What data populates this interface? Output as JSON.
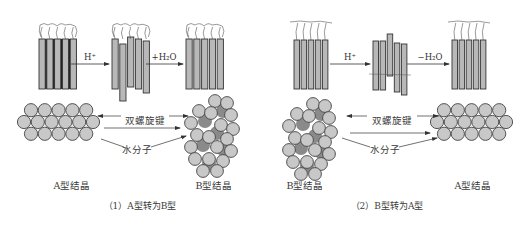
{
  "panels": [
    {
      "id": "a-to-b",
      "caption": "（1）A型转为B型",
      "caption_pos": [
        140,
        204
      ],
      "reaction_1": {
        "label": "H⁺",
        "pos": [
          90,
          61
        ]
      },
      "reaction_2": {
        "label": "+H₂O",
        "pos": [
          163,
          61
        ]
      },
      "label_helix": {
        "text": "双螺旋键",
        "pos": [
          145,
          119
        ]
      },
      "label_water": {
        "text": "水分子",
        "pos": [
          137,
          150
        ]
      },
      "label_left_crystal": {
        "text": "A型结晶",
        "pos": [
          72,
          183
        ]
      },
      "label_right_crystal": {
        "text": "B型结晶",
        "pos": [
          214,
          183
        ]
      }
    },
    {
      "id": "b-to-a",
      "caption": "（2）B型转为A型",
      "caption_pos": [
        387,
        204
      ],
      "reaction_1": {
        "label": "H⁺",
        "pos": [
          348,
          61
        ]
      },
      "reaction_2": {
        "label": "−H₂O",
        "pos": [
          430,
          61
        ]
      },
      "label_helix": {
        "text": "双螺旋键",
        "pos": [
          392,
          119
        ]
      },
      "label_water": {
        "text": "水分子",
        "pos": [
          385,
          150
        ]
      },
      "label_left_crystal": {
        "text": "B型结晶",
        "pos": [
          305,
          183
        ]
      },
      "label_right_crystal": {
        "text": "A型结晶",
        "pos": [
          473,
          183
        ]
      }
    }
  ],
  "colors": {
    "bar_fill": "#b8b8b8",
    "bar_stroke": "#333333",
    "bar_gap_dark": "#222222",
    "circle_fill": "#c8c8c8",
    "circle_stroke": "#444444",
    "water_fill": "#8a8a8a",
    "arrow": "#333333"
  },
  "bar_groups": [
    {
      "x": 39,
      "y": 39,
      "w": 6.2,
      "gap": 1.6,
      "h": 50,
      "offsets": [
        0,
        0,
        0,
        0,
        0
      ],
      "dark_gaps": true,
      "strands": "a"
    },
    {
      "x": 112,
      "y": 39,
      "w": 6.2,
      "gap": 1.6,
      "h": 50,
      "offsets": [
        0,
        5,
        -2,
        0,
        2
      ],
      "extra": [
        0,
        7,
        0,
        0,
        2
      ],
      "dark_gaps": false,
      "strands": "a"
    },
    {
      "x": 186,
      "y": 39,
      "w": 6.2,
      "gap": 1.6,
      "h": 50,
      "offsets": [
        0,
        0,
        0,
        0,
        0
      ],
      "dark_gaps": false,
      "strands": "a"
    },
    {
      "x": 294,
      "y": 40,
      "w": 5.5,
      "gap": 1.6,
      "h": 49,
      "offsets": [
        0,
        0,
        0,
        0,
        0
      ],
      "dark_gaps": false,
      "strands": "b"
    },
    {
      "x": 373,
      "y": 41,
      "w": 5.5,
      "gap": 1.6,
      "h": 49,
      "offsets": [
        0,
        0,
        -7,
        2,
        3
      ],
      "extra": [
        0,
        0,
        -7,
        0,
        2
      ],
      "dark_gaps": false,
      "strands": "none"
    },
    {
      "x": 452,
      "y": 40,
      "w": 5.5,
      "gap": 1.6,
      "h": 49,
      "offsets": [
        0,
        0,
        0,
        0,
        0
      ],
      "dark_gaps": false,
      "strands": "b"
    }
  ],
  "reaction_arrows": [
    {
      "x1": 71,
      "x2": 109,
      "y": 64
    },
    {
      "x1": 146,
      "x2": 183,
      "y": 64
    },
    {
      "x1": 330,
      "x2": 370,
      "y": 64
    },
    {
      "x1": 407,
      "x2": 449,
      "y": 64
    }
  ],
  "crystals": [
    {
      "type": "A",
      "cx": 24,
      "cy": 122,
      "r": 6.6,
      "dx": 13.8,
      "dy": 11.8
    },
    {
      "type": "B",
      "cx": 215,
      "cy": 135
    },
    {
      "type": "B",
      "cx": 313,
      "cy": 138
    },
    {
      "type": "A",
      "cx": 437,
      "cy": 122,
      "r": 6.6,
      "dx": 13.8,
      "dy": 11.8
    }
  ]
}
